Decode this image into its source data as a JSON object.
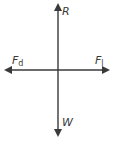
{
  "diagram": {
    "type": "free-body-diagram",
    "colors": {
      "line": "#3a3a3a",
      "background": "#ffffff"
    },
    "forces": {
      "up": {
        "symbol": "R",
        "subscript": ""
      },
      "down": {
        "symbol": "W",
        "subscript": ""
      },
      "left": {
        "symbol": "F",
        "subscript": "d"
      },
      "right": {
        "symbol": "F",
        "subscript": "l",
        "subscript_uncertain": true,
        "subscript_candidates": [
          "l",
          "t",
          "1"
        ]
      }
    }
  }
}
